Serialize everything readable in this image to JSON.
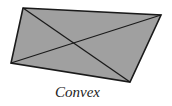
{
  "figure": {
    "caption": "Convex",
    "colors": {
      "fill": "#a0a0a0",
      "stroke": "#1a1a1a",
      "background": "#ffffff"
    },
    "quadrilateral": {
      "vertices": [
        [
          23,
          8
        ],
        [
          161,
          15
        ],
        [
          130,
          82
        ],
        [
          11,
          63
        ]
      ],
      "points": "23,8 161,15 130,82 11,63"
    },
    "diagonals": [
      {
        "x1": 23,
        "y1": 8,
        "x2": 130,
        "y2": 82
      },
      {
        "x1": 161,
        "y1": 15,
        "x2": 11,
        "y2": 63
      }
    ]
  }
}
